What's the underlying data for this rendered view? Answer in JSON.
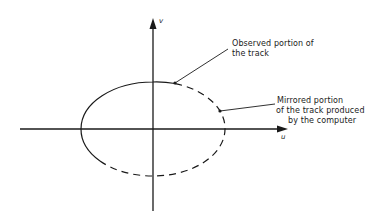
{
  "diagram": {
    "axes": {
      "vertical_label": "v",
      "horizontal_label": "u"
    },
    "annotations": {
      "observed": {
        "line1": "Observed portion of",
        "line2": "the track"
      },
      "mirrored": {
        "line1": "Mirrored portion",
        "line2": "of the track produced",
        "line3": "by the computer"
      }
    },
    "colors": {
      "stroke": "#1a1a1a",
      "background": "#ffffff"
    }
  }
}
